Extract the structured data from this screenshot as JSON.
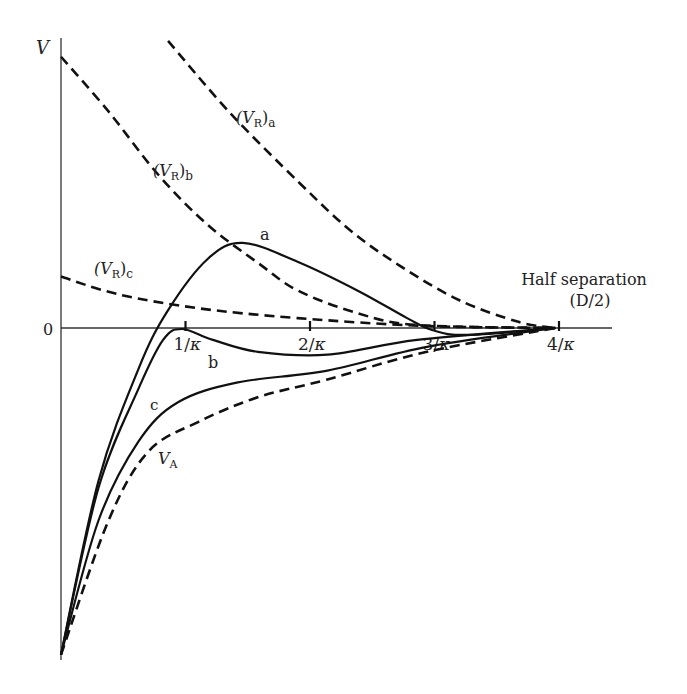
{
  "chart_data": {
    "type": "line",
    "title": "",
    "ylabel": "V",
    "xlabel": "Half separation (D/2)",
    "xlabel_line1": "Half separation",
    "xlabel_line2": "(D/2)",
    "y_zero_label": "0",
    "x_unit": "1/κ",
    "xlim": [
      0,
      4.4
    ],
    "ylim": [
      -3.3,
      2.9
    ],
    "grid": false,
    "x_ticks": [
      {
        "value": 1,
        "num": "1",
        "den": "κ"
      },
      {
        "value": 2,
        "num": "2",
        "den": "κ"
      },
      {
        "value": 3,
        "num": "3",
        "den": "κ"
      },
      {
        "value": 4,
        "num": "4",
        "den": "κ"
      }
    ],
    "series": [
      {
        "id": "vr_a",
        "name": "(V_R)a",
        "label_main": "(V",
        "label_sub1": "R",
        "label_close": ")",
        "label_sub2": "a",
        "style": "dashed",
        "x": [
          0.86,
          1.36,
          1.92,
          2.32,
          2.72,
          3.2,
          3.68,
          3.97
        ],
        "y": [
          2.9,
          2.17,
          1.46,
          0.99,
          0.63,
          0.28,
          0.06,
          0.0
        ]
      },
      {
        "id": "vr_b",
        "name": "(V_R)b",
        "label_main": "(V",
        "label_sub1": "R",
        "label_close": ")",
        "label_sub2": "b",
        "style": "dashed",
        "x": [
          0.0,
          0.38,
          0.78,
          1.18,
          1.58,
          1.9,
          2.38,
          2.86,
          3.97
        ],
        "y": [
          2.74,
          2.19,
          1.55,
          1.04,
          0.66,
          0.38,
          0.15,
          0.03,
          0.0
        ]
      },
      {
        "id": "vr_c",
        "name": "(V_R)c",
        "label_main": "(V",
        "label_sub1": "R",
        "label_close": ")",
        "label_sub2": "c",
        "style": "dashed",
        "x": [
          0.0,
          0.46,
          1.1,
          1.9,
          2.94,
          3.97
        ],
        "y": [
          0.52,
          0.34,
          0.2,
          0.1,
          0.02,
          0.0
        ]
      },
      {
        "id": "curve_a",
        "name": "a",
        "style": "solid",
        "x": [
          0.0,
          0.3,
          0.62,
          0.86,
          1.18,
          1.46,
          1.9,
          2.38,
          2.78,
          2.98,
          3.26,
          3.97
        ],
        "y": [
          -3.3,
          -1.55,
          -0.42,
          0.18,
          0.7,
          0.86,
          0.67,
          0.38,
          0.1,
          -0.02,
          -0.07,
          0.0
        ]
      },
      {
        "id": "curve_b",
        "name": "b",
        "style": "solid",
        "x": [
          0.0,
          0.3,
          0.62,
          0.82,
          0.97,
          1.22,
          1.58,
          2.14,
          2.86,
          3.97
        ],
        "y": [
          -3.3,
          -1.62,
          -0.62,
          -0.12,
          -0.01,
          -0.12,
          -0.24,
          -0.27,
          -0.12,
          0.0
        ]
      },
      {
        "id": "curve_c",
        "name": "c",
        "style": "solid",
        "x": [
          0.0,
          0.3,
          0.62,
          0.94,
          1.42,
          2.14,
          2.94,
          3.97
        ],
        "y": [
          -3.3,
          -1.95,
          -1.15,
          -0.75,
          -0.55,
          -0.43,
          -0.19,
          0.0
        ]
      },
      {
        "id": "v_a",
        "name": "V_A",
        "label_main": "V",
        "label_sub1": "A",
        "style": "dashed",
        "x": [
          0.0,
          0.38,
          0.7,
          1.1,
          1.58,
          2.14,
          2.94,
          3.97
        ],
        "y": [
          -3.3,
          -1.95,
          -1.25,
          -0.95,
          -0.7,
          -0.52,
          -0.24,
          0.0
        ]
      }
    ],
    "annotations": [
      "(V_R)a",
      "(V_R)b",
      "(V_R)c",
      "a",
      "b",
      "c",
      "V_A"
    ]
  }
}
